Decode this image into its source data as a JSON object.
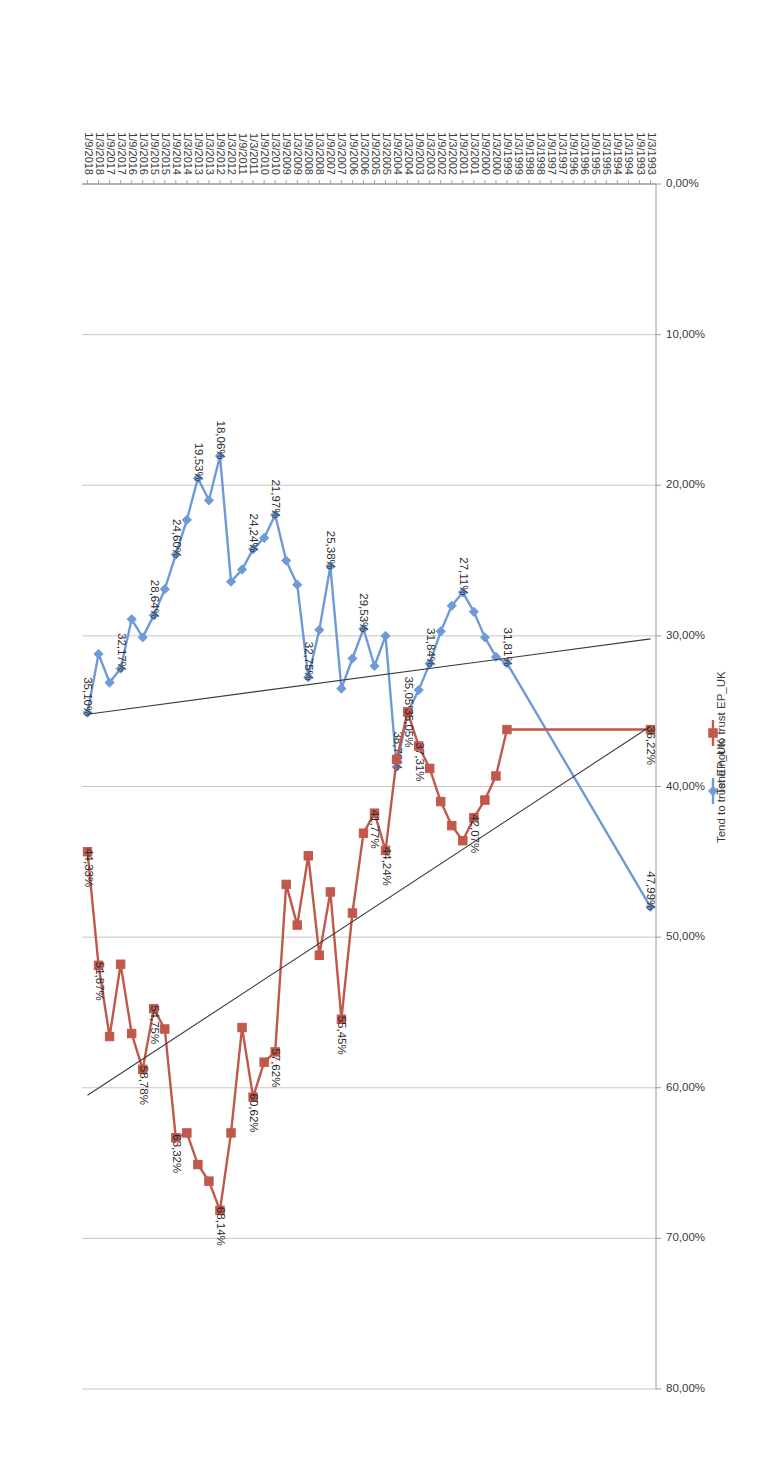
{
  "chart_data": {
    "type": "line",
    "title": "",
    "xlabel": "",
    "ylabel": "",
    "ylim": [
      0,
      80
    ],
    "ytick_labels": [
      "0,00%",
      "10,00%",
      "20,00%",
      "30,00%",
      "40,00%",
      "50,00%",
      "60,00%",
      "70,00%",
      "80,00%"
    ],
    "ytick_values": [
      0,
      10,
      20,
      30,
      40,
      50,
      60,
      70,
      80
    ],
    "grid": true,
    "legend_position": "right",
    "number_format": "comma-decimal-percent",
    "categories": [
      "1/3/1993",
      "1/9/1993",
      "1/3/1994",
      "1/9/1994",
      "1/3/1995",
      "1/9/1995",
      "1/3/1996",
      "1/9/1996",
      "1/3/1997",
      "1/9/1997",
      "1/3/1998",
      "1/9/1998",
      "1/3/1999",
      "1/9/1999",
      "1/3/2000",
      "1/9/2000",
      "1/3/2001",
      "1/9/2001",
      "1/3/2002",
      "1/9/2002",
      "1/3/2003",
      "1/9/2003",
      "1/3/2004",
      "1/9/2004",
      "1/3/2005",
      "1/9/2005",
      "1/3/2006",
      "1/9/2006",
      "1/3/2007",
      "1/9/2007",
      "1/3/2008",
      "1/9/2008",
      "1/3/2009",
      "1/9/2009",
      "1/3/2010",
      "1/9/2010",
      "1/3/2011",
      "1/9/2011",
      "1/3/2012",
      "1/9/2012",
      "1/3/2013",
      "1/9/2013",
      "1/3/2014",
      "1/9/2014",
      "1/3/2015",
      "1/9/2015",
      "1/3/2016",
      "1/9/2016",
      "1/3/2017",
      "1/9/2017",
      "1/3/2018",
      "1/9/2018"
    ],
    "series": [
      {
        "name": "Tend to trust EP_UK",
        "color": "#6E9BD8",
        "marker": "diamond",
        "values": [
          47.99,
          null,
          null,
          null,
          null,
          null,
          null,
          null,
          null,
          null,
          null,
          null,
          null,
          31.81,
          31.4,
          30.1,
          28.4,
          27.11,
          28.0,
          29.7,
          31.84,
          33.6,
          35.05,
          38.7,
          30.0,
          32.0,
          29.53,
          31.5,
          33.5,
          25.38,
          29.6,
          32.75,
          26.6,
          25.0,
          21.97,
          23.5,
          24.24,
          25.6,
          26.4,
          18.06,
          21.0,
          19.53,
          22.3,
          24.6,
          26.9,
          28.64,
          30.1,
          28.9,
          32.17,
          33.1,
          31.2,
          35.1
        ],
        "labeled_points": [
          {
            "category": "1/3/1993",
            "value": 47.99,
            "label": "47,99%"
          },
          {
            "category": "1/9/1999",
            "value": 31.81,
            "label": "31,81%"
          },
          {
            "category": "1/9/2001",
            "value": 27.11,
            "label": "27,11%"
          },
          {
            "category": "1/3/2003",
            "value": 31.84,
            "label": "31,84%"
          },
          {
            "category": "1/3/2004",
            "value": 35.05,
            "label": "35,05%"
          },
          {
            "category": "1/9/2004",
            "value": 38.7,
            "label": "38,70%"
          },
          {
            "category": "1/3/2006",
            "value": 29.53,
            "label": "29,53%"
          },
          {
            "category": "1/9/2007",
            "value": 25.38,
            "label": "25,38%"
          },
          {
            "category": "1/9/2008",
            "value": 32.75,
            "label": "32,75%"
          },
          {
            "category": "1/3/2010",
            "value": 21.97,
            "label": "21,97%"
          },
          {
            "category": "1/3/2011",
            "value": 24.24,
            "label": "24,24%"
          },
          {
            "category": "1/9/2012",
            "value": 18.06,
            "label": "18,06%"
          },
          {
            "category": "1/9/2013",
            "value": 19.53,
            "label": "19,53%"
          },
          {
            "category": "1/9/2014",
            "value": 24.6,
            "label": "24,60%"
          },
          {
            "category": "1/9/2015",
            "value": 28.64,
            "label": "28,64%"
          },
          {
            "category": "1/3/2017",
            "value": 32.17,
            "label": "32,17%"
          },
          {
            "category": "1/9/2018",
            "value": 35.1,
            "label": "35,10%"
          }
        ],
        "trendline": {
          "type": "linear",
          "color": "#3b3b3b",
          "start_value": 30.2,
          "end_value": 35.2
        }
      },
      {
        "name": "Tend not to trust EP_UK",
        "color": "#C0584B",
        "marker": "square",
        "values": [
          36.22,
          null,
          null,
          null,
          null,
          null,
          null,
          null,
          null,
          null,
          null,
          null,
          null,
          36.22,
          39.3,
          40.9,
          42.07,
          43.6,
          42.6,
          41.0,
          38.8,
          37.31,
          35.05,
          38.2,
          44.24,
          41.77,
          43.1,
          48.4,
          55.45,
          47.0,
          51.2,
          44.6,
          49.2,
          46.5,
          57.62,
          58.3,
          60.62,
          56.0,
          63.0,
          68.14,
          66.2,
          65.1,
          63.0,
          63.32,
          56.1,
          54.75,
          58.78,
          56.4,
          51.8,
          56.6,
          51.87,
          44.33
        ],
        "labeled_points": [
          {
            "category": "1/3/1993",
            "value": 36.22,
            "label": "36,22%"
          },
          {
            "category": "1/3/2001",
            "value": 42.07,
            "label": "42,07%"
          },
          {
            "category": "1/9/2003",
            "value": 37.31,
            "label": "37,31%"
          },
          {
            "category": "1/3/2004",
            "value": 35.05,
            "label": "35,05%"
          },
          {
            "category": "1/3/2005",
            "value": 44.24,
            "label": "44,24%"
          },
          {
            "category": "1/9/2005",
            "value": 41.77,
            "label": "41,77%"
          },
          {
            "category": "1/3/2007",
            "value": 55.45,
            "label": "55,45%"
          },
          {
            "category": "1/3/2010",
            "value": 57.62,
            "label": "57,62%"
          },
          {
            "category": "1/3/2011",
            "value": 60.62,
            "label": "60,62%"
          },
          {
            "category": "1/9/2012",
            "value": 68.14,
            "label": "68,14%"
          },
          {
            "category": "1/9/2014",
            "value": 63.32,
            "label": "63,32%"
          },
          {
            "category": "1/9/2015",
            "value": 54.75,
            "label": "54,75%"
          },
          {
            "category": "1/3/2016",
            "value": 58.78,
            "label": "58,78%"
          },
          {
            "category": "1/3/2018",
            "value": 51.87,
            "label": "51,87%"
          },
          {
            "category": "1/9/2018",
            "value": 44.33,
            "label": "44,33%"
          }
        ],
        "trendline": {
          "type": "linear",
          "color": "#3b3b3b",
          "start_value": 36.0,
          "end_value": 60.5
        }
      }
    ]
  },
  "legend": {
    "items": [
      {
        "label": "Tend to trust EP_UK",
        "color": "#6E9BD8",
        "marker": "diamond"
      },
      {
        "label": "Tend not to trust EP_UK",
        "color": "#C0584B",
        "marker": "square"
      }
    ]
  },
  "axes": {
    "y_axis_name": "percentage-axis",
    "x_axis_name": "date-category-axis"
  },
  "colors": {
    "series_trust": "#6E9BD8",
    "series_distrust": "#C0584B",
    "gridline": "#BFBFBF",
    "trendline": "#3b3b3b",
    "text": "#3a3a3a",
    "background": "#ffffff"
  }
}
